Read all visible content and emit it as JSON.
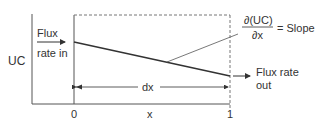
{
  "diagram": {
    "y_label": "UC",
    "x_label": "x",
    "x_ticks": [
      "0",
      "1"
    ],
    "flux_in": [
      "Flux",
      "rate in"
    ],
    "flux_out": [
      "Flux rate",
      "out"
    ],
    "interval_label": "dx",
    "slope_numerator": "∂(UC)",
    "slope_denominator": "∂x",
    "slope_equals": "= Slope"
  }
}
